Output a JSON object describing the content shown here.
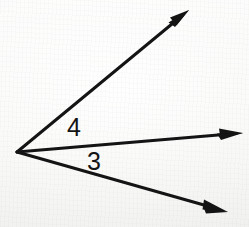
{
  "figure": {
    "background_color": "#f7f7f5",
    "stroke_color": "#141414",
    "vertex": {
      "x": 17,
      "y": 152,
      "name": "common-vertex"
    },
    "rays": [
      {
        "id": "upper-ray",
        "label": "upper ray",
        "from": {
          "x": 17,
          "y": 152
        },
        "to": {
          "x": 189,
          "y": 10
        },
        "arrowhead": true,
        "stroke_width": 3
      },
      {
        "id": "middle-ray",
        "label": "middle ray",
        "from": {
          "x": 17,
          "y": 152
        },
        "to": {
          "x": 243,
          "y": 133
        },
        "arrowhead": true,
        "stroke_width": 3
      },
      {
        "id": "lower-ray",
        "label": "lower ray",
        "from": {
          "x": 17,
          "y": 152
        },
        "to": {
          "x": 228,
          "y": 212
        },
        "arrowhead": true,
        "stroke_width": 3
      }
    ],
    "angle_labels": [
      {
        "id": "angle-4",
        "text": "4",
        "between": [
          "upper-ray",
          "middle-ray"
        ],
        "x": 67,
        "y": 115
      },
      {
        "id": "angle-3",
        "text": "3",
        "between": [
          "middle-ray",
          "lower-ray"
        ],
        "x": 87,
        "y": 149
      }
    ]
  }
}
